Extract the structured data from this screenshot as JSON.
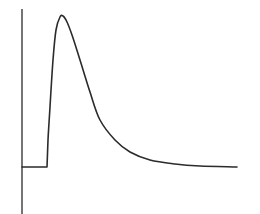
{
  "chart_data": {
    "type": "line",
    "title": "",
    "xlabel": "",
    "ylabel": "",
    "grid": false,
    "legend": null,
    "axes": {
      "y_axis": {
        "x": 22,
        "y_top": 9,
        "y_bottom": 214,
        "ticks": []
      }
    },
    "series": [
      {
        "name": "response",
        "color": "#2b2b2b",
        "points_px": [
          [
            22,
            167
          ],
          [
            47,
            167
          ],
          [
            48,
            140
          ],
          [
            50,
            107
          ],
          [
            53,
            60
          ],
          [
            56,
            30
          ],
          [
            60,
            17
          ],
          [
            63,
            16
          ],
          [
            67,
            22
          ],
          [
            72,
            35
          ],
          [
            80,
            60
          ],
          [
            90,
            92
          ],
          [
            100,
            120
          ],
          [
            115,
            140
          ],
          [
            130,
            152
          ],
          [
            150,
            160
          ],
          [
            175,
            164
          ],
          [
            200,
            166
          ],
          [
            237,
            167
          ]
        ]
      }
    ],
    "colors": {
      "background": "#ffffff",
      "line": "#2b2b2b",
      "axis": "#3a3a3a"
    }
  }
}
